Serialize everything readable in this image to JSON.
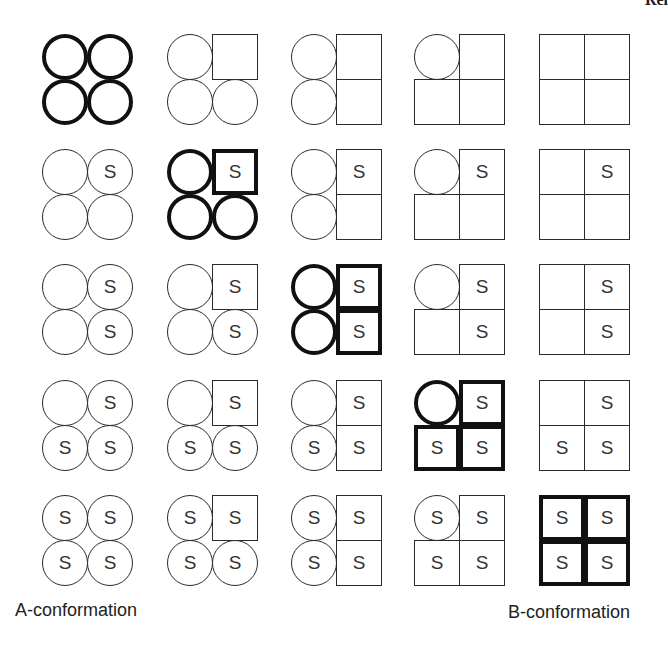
{
  "top_fragment": "Rel",
  "s_label": "S",
  "labels": {
    "left": "A-conformation",
    "right": "B-conformation"
  },
  "grid": {
    "rows": 5,
    "cols": 5,
    "subunit_order": [
      "tl",
      "tr",
      "bl",
      "br"
    ],
    "legend": "circle = A-state subunit, square = B-state subunit, S = substrate bound",
    "cells": [
      [
        {
          "bold": true,
          "units": [
            [
              "circle",
              ""
            ],
            [
              "circle",
              ""
            ],
            [
              "circle",
              ""
            ],
            [
              "circle",
              ""
            ]
          ]
        },
        {
          "bold": false,
          "units": [
            [
              "circle",
              ""
            ],
            [
              "square",
              ""
            ],
            [
              "circle",
              ""
            ],
            [
              "circle",
              ""
            ]
          ]
        },
        {
          "bold": false,
          "units": [
            [
              "circle",
              ""
            ],
            [
              "square",
              ""
            ],
            [
              "circle",
              ""
            ],
            [
              "square",
              ""
            ]
          ]
        },
        {
          "bold": false,
          "units": [
            [
              "circle",
              ""
            ],
            [
              "square",
              ""
            ],
            [
              "square",
              ""
            ],
            [
              "square",
              ""
            ]
          ]
        },
        {
          "bold": false,
          "units": [
            [
              "square",
              ""
            ],
            [
              "square",
              ""
            ],
            [
              "square",
              ""
            ],
            [
              "square",
              ""
            ]
          ]
        }
      ],
      [
        {
          "bold": false,
          "units": [
            [
              "circle",
              ""
            ],
            [
              "circle",
              "S"
            ],
            [
              "circle",
              ""
            ],
            [
              "circle",
              ""
            ]
          ]
        },
        {
          "bold": true,
          "units": [
            [
              "circle",
              ""
            ],
            [
              "square",
              "S"
            ],
            [
              "circle",
              ""
            ],
            [
              "circle",
              ""
            ]
          ]
        },
        {
          "bold": false,
          "units": [
            [
              "circle",
              ""
            ],
            [
              "square",
              "S"
            ],
            [
              "circle",
              ""
            ],
            [
              "square",
              ""
            ]
          ]
        },
        {
          "bold": false,
          "units": [
            [
              "circle",
              ""
            ],
            [
              "square",
              "S"
            ],
            [
              "square",
              ""
            ],
            [
              "square",
              ""
            ]
          ]
        },
        {
          "bold": false,
          "units": [
            [
              "square",
              ""
            ],
            [
              "square",
              "S"
            ],
            [
              "square",
              ""
            ],
            [
              "square",
              ""
            ]
          ]
        }
      ],
      [
        {
          "bold": false,
          "units": [
            [
              "circle",
              ""
            ],
            [
              "circle",
              "S"
            ],
            [
              "circle",
              ""
            ],
            [
              "circle",
              "S"
            ]
          ]
        },
        {
          "bold": false,
          "units": [
            [
              "circle",
              ""
            ],
            [
              "square",
              "S"
            ],
            [
              "circle",
              ""
            ],
            [
              "circle",
              "S"
            ]
          ]
        },
        {
          "bold": true,
          "units": [
            [
              "circle",
              ""
            ],
            [
              "square",
              "S"
            ],
            [
              "circle",
              ""
            ],
            [
              "square",
              "S"
            ]
          ]
        },
        {
          "bold": false,
          "units": [
            [
              "circle",
              ""
            ],
            [
              "square",
              "S"
            ],
            [
              "square",
              ""
            ],
            [
              "square",
              "S"
            ]
          ]
        },
        {
          "bold": false,
          "units": [
            [
              "square",
              ""
            ],
            [
              "square",
              "S"
            ],
            [
              "square",
              ""
            ],
            [
              "square",
              "S"
            ]
          ]
        }
      ],
      [
        {
          "bold": false,
          "units": [
            [
              "circle",
              ""
            ],
            [
              "circle",
              "S"
            ],
            [
              "circle",
              "S"
            ],
            [
              "circle",
              "S"
            ]
          ]
        },
        {
          "bold": false,
          "units": [
            [
              "circle",
              ""
            ],
            [
              "square",
              "S"
            ],
            [
              "circle",
              "S"
            ],
            [
              "circle",
              "S"
            ]
          ]
        },
        {
          "bold": false,
          "units": [
            [
              "circle",
              ""
            ],
            [
              "square",
              "S"
            ],
            [
              "circle",
              "S"
            ],
            [
              "square",
              "S"
            ]
          ]
        },
        {
          "bold": true,
          "units": [
            [
              "circle",
              ""
            ],
            [
              "square",
              "S"
            ],
            [
              "square",
              "S"
            ],
            [
              "square",
              "S"
            ]
          ]
        },
        {
          "bold": false,
          "units": [
            [
              "square",
              ""
            ],
            [
              "square",
              "S"
            ],
            [
              "square",
              "S"
            ],
            [
              "square",
              "S"
            ]
          ]
        }
      ],
      [
        {
          "bold": false,
          "units": [
            [
              "circle",
              "S"
            ],
            [
              "circle",
              "S"
            ],
            [
              "circle",
              "S"
            ],
            [
              "circle",
              "S"
            ]
          ]
        },
        {
          "bold": false,
          "units": [
            [
              "circle",
              "S"
            ],
            [
              "square",
              "S"
            ],
            [
              "circle",
              "S"
            ],
            [
              "circle",
              "S"
            ]
          ]
        },
        {
          "bold": false,
          "units": [
            [
              "circle",
              "S"
            ],
            [
              "square",
              "S"
            ],
            [
              "circle",
              "S"
            ],
            [
              "square",
              "S"
            ]
          ]
        },
        {
          "bold": false,
          "units": [
            [
              "circle",
              "S"
            ],
            [
              "square",
              "S"
            ],
            [
              "square",
              "S"
            ],
            [
              "square",
              "S"
            ]
          ]
        },
        {
          "bold": true,
          "units": [
            [
              "square",
              "S"
            ],
            [
              "square",
              "S"
            ],
            [
              "square",
              "S"
            ],
            [
              "square",
              "S"
            ]
          ]
        }
      ]
    ]
  }
}
